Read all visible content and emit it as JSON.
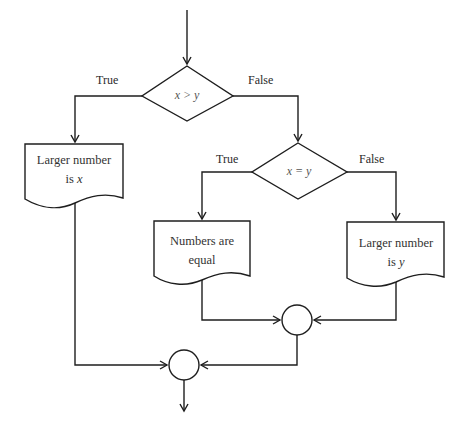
{
  "diagram": {
    "type": "flowchart",
    "title": "",
    "decisions": [
      {
        "id": "d1",
        "condition": "x > y",
        "true_label": "True",
        "false_label": "False"
      },
      {
        "id": "d2",
        "condition": "x = y",
        "true_label": "True",
        "false_label": "False"
      }
    ],
    "outputs": [
      {
        "id": "o1",
        "line1": "Larger number",
        "line2_prefix": "is ",
        "line2_var": "x"
      },
      {
        "id": "o2",
        "line1": "Numbers are",
        "line2_prefix": "equal",
        "line2_var": ""
      },
      {
        "id": "o3",
        "line1": "Larger number",
        "line2_prefix": "is ",
        "line2_var": "y"
      }
    ],
    "connectors": [
      {
        "id": "c1",
        "joins": [
          "o2",
          "o3"
        ]
      },
      {
        "id": "c2",
        "joins": [
          "o1",
          "c1"
        ]
      }
    ],
    "edges": [
      {
        "from": "start",
        "to": "d1"
      },
      {
        "from": "d1",
        "to": "o1",
        "label": "True"
      },
      {
        "from": "d1",
        "to": "d2",
        "label": "False"
      },
      {
        "from": "d2",
        "to": "o2",
        "label": "True"
      },
      {
        "from": "d2",
        "to": "o3",
        "label": "False"
      },
      {
        "from": "o2",
        "to": "c1"
      },
      {
        "from": "o3",
        "to": "c1"
      },
      {
        "from": "o1",
        "to": "c2"
      },
      {
        "from": "c1",
        "to": "c2"
      },
      {
        "from": "c2",
        "to": "end"
      }
    ],
    "colors": {
      "line": "#1e1e1e",
      "background": "#ffffff"
    }
  }
}
